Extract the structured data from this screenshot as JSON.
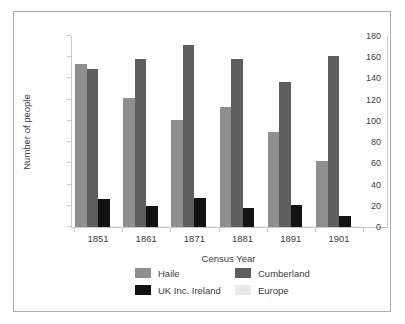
{
  "frame": {
    "border_color": "#ababab",
    "background": "#ffffff"
  },
  "axis": {
    "line_color": "#c9c9c9",
    "text_color": "#3d3d3d"
  },
  "chart_data": {
    "type": "bar",
    "title": "",
    "xlabel": "Census Year",
    "ylabel": "Number of people",
    "categories": [
      "1851",
      "1861",
      "1871",
      "1881",
      "1891",
      "1901"
    ],
    "series": [
      {
        "name": "Haile",
        "color": "#8f8f8f",
        "values": [
          154,
          122,
          101,
          113,
          90,
          62
        ]
      },
      {
        "name": "Cumberland",
        "color": "#5e5e5e",
        "values": [
          149,
          158,
          172,
          158,
          137,
          161
        ]
      },
      {
        "name": "UK Inc. Ireland",
        "color": "#121212",
        "values": [
          26,
          20,
          27,
          18,
          21,
          10
        ]
      },
      {
        "name": "Europe",
        "color": "#e9e9e9",
        "values": [
          1,
          1,
          1,
          1,
          1,
          1
        ]
      }
    ],
    "ylim": [
      0,
      180
    ],
    "yticks": [
      0,
      20,
      40,
      60,
      80,
      100,
      120,
      140,
      160,
      180
    ],
    "grid": false,
    "legend_position": "bottom"
  }
}
